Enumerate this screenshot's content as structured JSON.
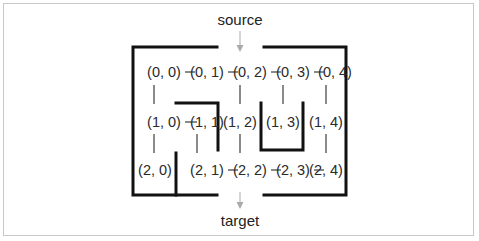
{
  "diagram": {
    "source_label": "source",
    "target_label": "target",
    "nodes": [
      {
        "id": "0,0",
        "label": "(0, 0)",
        "x": 164,
        "y": 77
      },
      {
        "id": "0,1",
        "label": "(0, 1)",
        "x": 207,
        "y": 77
      },
      {
        "id": "0,2",
        "label": "(0, 2)",
        "x": 240,
        "y": 77
      },
      {
        "id": "0,3",
        "label": "(0, 3)",
        "x": 283,
        "y": 77
      },
      {
        "id": "0,4",
        "label": "(0, 4)",
        "x": 326,
        "y": 77
      },
      {
        "id": "1,0",
        "label": "(1, 0)",
        "x": 164,
        "y": 127
      },
      {
        "id": "1,1",
        "label": "(1, 1)",
        "x": 207,
        "y": 127
      },
      {
        "id": "1,2",
        "label": "(1, 2)",
        "x": 240,
        "y": 127
      },
      {
        "id": "1,3",
        "label": "(1, 3)",
        "x": 283,
        "y": 127
      },
      {
        "id": "1,4",
        "label": "(1, 4)",
        "x": 326,
        "y": 127
      },
      {
        "id": "2,0",
        "label": "(2, 0)",
        "x": 164,
        "y": 175
      },
      {
        "id": "2,1",
        "label": "(2, 1)",
        "x": 207,
        "y": 175
      },
      {
        "id": "2,2",
        "label": "(2, 2)",
        "x": 240,
        "y": 175
      },
      {
        "id": "2,3",
        "label": "(2, 3)",
        "x": 283,
        "y": 175
      },
      {
        "id": "2,4",
        "label": "(2, 4)",
        "x": 326,
        "y": 175
      }
    ],
    "edges": [
      [
        "0,0",
        "0,1"
      ],
      [
        "0,1",
        "0,2"
      ],
      [
        "0,2",
        "0,3"
      ],
      [
        "0,3",
        "0,4"
      ],
      [
        "0,0",
        "1,0"
      ],
      [
        "0,2",
        "1,2"
      ],
      [
        "0,3",
        "1,3"
      ],
      [
        "0,4",
        "1,4"
      ],
      [
        "1,0",
        "1,1"
      ],
      [
        "1,0",
        "2,0"
      ],
      [
        "1,1",
        "2,1"
      ],
      [
        "1,2",
        "2,2"
      ],
      [
        "1,4",
        "2,4"
      ],
      [
        "2,1",
        "2,2"
      ],
      [
        "2,2",
        "2,3"
      ],
      [
        "2,3",
        "2,4"
      ]
    ],
    "colors": {
      "wall": "#111111",
      "edge": "#2a2a2a",
      "arrow": "#aaaaaa",
      "frame": "#c8c8c8"
    }
  }
}
